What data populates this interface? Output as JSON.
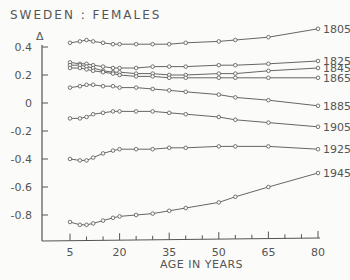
{
  "chart_data": {
    "type": "line",
    "title": "SWEDEN : FEMALES",
    "xlabel": "AGE IN YEARS",
    "ylabel": "Δ",
    "x_ticks": [
      5,
      20,
      35,
      50,
      65,
      80
    ],
    "y_ticks": [
      0.4,
      0.2,
      0,
      -0.2,
      -0.4,
      -0.6,
      -0.8
    ],
    "ylim": [
      -1.0,
      0.45
    ],
    "xlim": [
      0,
      80
    ],
    "series": [
      {
        "name": "1805",
        "x": [
          5,
          8,
          10,
          12,
          15,
          18,
          20,
          25,
          30,
          35,
          40,
          50,
          55,
          65,
          80
        ],
        "values": [
          0.43,
          0.44,
          0.45,
          0.44,
          0.43,
          0.42,
          0.42,
          0.42,
          0.42,
          0.42,
          0.43,
          0.44,
          0.45,
          0.47,
          0.53
        ]
      },
      {
        "name": "1825",
        "x": [
          5,
          8,
          10,
          12,
          15,
          18,
          20,
          25,
          30,
          35,
          40,
          50,
          55,
          65,
          80
        ],
        "values": [
          0.29,
          0.28,
          0.28,
          0.27,
          0.26,
          0.25,
          0.25,
          0.25,
          0.26,
          0.26,
          0.26,
          0.27,
          0.27,
          0.28,
          0.3
        ]
      },
      {
        "name": "1845",
        "x": [
          5,
          8,
          10,
          12,
          15,
          18,
          20,
          25,
          30,
          35,
          40,
          50,
          55,
          65,
          80
        ],
        "values": [
          0.27,
          0.27,
          0.26,
          0.25,
          0.23,
          0.22,
          0.22,
          0.21,
          0.21,
          0.2,
          0.2,
          0.21,
          0.21,
          0.23,
          0.25
        ]
      },
      {
        "name": "1865",
        "x": [
          5,
          8,
          10,
          12,
          15,
          18,
          20,
          25,
          30,
          35,
          40,
          50,
          55,
          65,
          80
        ],
        "values": [
          0.25,
          0.25,
          0.24,
          0.23,
          0.22,
          0.21,
          0.2,
          0.19,
          0.19,
          0.18,
          0.18,
          0.18,
          0.18,
          0.18,
          0.18
        ]
      },
      {
        "name": "1885",
        "x": [
          5,
          8,
          10,
          12,
          15,
          18,
          20,
          25,
          30,
          35,
          40,
          50,
          55,
          65,
          80
        ],
        "values": [
          0.11,
          0.12,
          0.13,
          0.13,
          0.12,
          0.12,
          0.11,
          0.11,
          0.1,
          0.09,
          0.08,
          0.06,
          0.04,
          0.02,
          -0.02
        ]
      },
      {
        "name": "1905",
        "x": [
          5,
          8,
          10,
          12,
          15,
          18,
          20,
          25,
          30,
          35,
          40,
          50,
          55,
          65,
          80
        ],
        "values": [
          -0.11,
          -0.11,
          -0.1,
          -0.08,
          -0.07,
          -0.06,
          -0.06,
          -0.06,
          -0.06,
          -0.07,
          -0.08,
          -0.1,
          -0.12,
          -0.14,
          -0.17
        ]
      },
      {
        "name": "1925",
        "x": [
          5,
          8,
          10,
          12,
          15,
          18,
          20,
          25,
          30,
          35,
          40,
          50,
          55,
          65,
          80
        ],
        "values": [
          -0.4,
          -0.41,
          -0.41,
          -0.39,
          -0.36,
          -0.34,
          -0.33,
          -0.33,
          -0.33,
          -0.32,
          -0.32,
          -0.31,
          -0.31,
          -0.31,
          -0.33
        ]
      },
      {
        "name": "1945",
        "x": [
          5,
          8,
          10,
          12,
          15,
          18,
          20,
          25,
          30,
          35,
          40,
          50,
          55,
          65,
          80
        ],
        "values": [
          -0.85,
          -0.87,
          -0.87,
          -0.86,
          -0.84,
          -0.82,
          -0.81,
          -0.8,
          -0.79,
          -0.77,
          -0.75,
          -0.71,
          -0.67,
          -0.6,
          -0.5
        ]
      }
    ]
  }
}
